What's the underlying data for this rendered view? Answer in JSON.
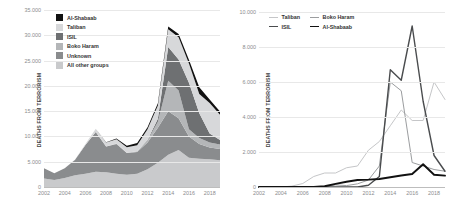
{
  "chart_data": [
    {
      "type": "area",
      "panel": "left",
      "title": "",
      "xlabel": "",
      "ylabel": "DEATHS FROM TERRORISM",
      "xlim": [
        2002,
        2019
      ],
      "ylim": [
        0,
        35000
      ],
      "grid": true,
      "stacked": true,
      "legend_position": "top-left",
      "x": [
        2002,
        2003,
        2004,
        2005,
        2006,
        2007,
        2008,
        2009,
        2010,
        2011,
        2012,
        2013,
        2014,
        2015,
        2016,
        2017,
        2018,
        2019
      ],
      "xticks": [
        "2002",
        "2004",
        "2006",
        "2008",
        "2010",
        "2012",
        "2014",
        "2016",
        "2018"
      ],
      "yticks": [
        "0",
        "5.000",
        "10.000",
        "15.000",
        "20.000",
        "25.000",
        "30.000",
        "35.000"
      ],
      "series": [
        {
          "name": "All other groups",
          "color": "#c9cacc",
          "values": [
            1700,
            1400,
            1800,
            2300,
            2600,
            3000,
            2900,
            2600,
            2400,
            2600,
            3500,
            4800,
            6400,
            7300,
            5800,
            5600,
            5500,
            5300
          ]
        },
        {
          "name": "Unknown",
          "color": "#8a8c8e",
          "values": [
            2000,
            1300,
            1900,
            3100,
            5700,
            7900,
            5100,
            5900,
            4300,
            4300,
            5300,
            6900,
            8600,
            6300,
            4200,
            2900,
            2300,
            2200
          ]
        },
        {
          "name": "Boko Haram",
          "color": "#b4b6b8",
          "values": [
            0,
            0,
            0,
            0,
            0,
            0,
            20,
            120,
            80,
            180,
            400,
            1200,
            6000,
            5500,
            1400,
            1200,
            1000,
            900
          ]
        },
        {
          "name": "ISIL",
          "color": "#6e7072",
          "values": [
            0,
            0,
            0,
            0,
            0,
            0,
            0,
            0,
            0,
            0,
            100,
            600,
            6700,
            6100,
            9200,
            4900,
            1800,
            900
          ]
        },
        {
          "name": "Taliban",
          "color": "#d7d8da",
          "values": [
            0,
            0,
            0,
            50,
            200,
            600,
            800,
            800,
            1100,
            1200,
            2100,
            2600,
            3500,
            4400,
            3800,
            3800,
            6000,
            5000
          ]
        },
        {
          "name": "Al-Shabaab",
          "color": "#111111",
          "values": [
            0,
            0,
            0,
            0,
            0,
            0,
            40,
            180,
            300,
            400,
            420,
            460,
            560,
            660,
            740,
            1300,
            700,
            650
          ]
        }
      ]
    },
    {
      "type": "line",
      "panel": "right",
      "title": "",
      "xlabel": "",
      "ylabel": "DEATHS FROM TERRORISM",
      "xlim": [
        2002,
        2019
      ],
      "ylim": [
        0,
        10000
      ],
      "grid": true,
      "legend_position": "top-center",
      "x": [
        2002,
        2003,
        2004,
        2005,
        2006,
        2007,
        2008,
        2009,
        2010,
        2011,
        2012,
        2013,
        2014,
        2015,
        2016,
        2017,
        2018,
        2019
      ],
      "xticks": [
        "2002",
        "2004",
        "2006",
        "2008",
        "2010",
        "2012",
        "2014",
        "2016",
        "2018"
      ],
      "yticks": [
        "0",
        "2.000",
        "4.000",
        "6.000",
        "8.000",
        "10.000"
      ],
      "series": [
        {
          "name": "Taliban",
          "color": "#c5c6c8",
          "width": 1,
          "values": [
            0,
            0,
            0,
            50,
            200,
            600,
            800,
            800,
            1100,
            1200,
            2100,
            2600,
            3500,
            4400,
            3800,
            3800,
            6000,
            5000
          ]
        },
        {
          "name": "Boko Haram",
          "color": "#9b9d9f",
          "width": 1,
          "values": [
            0,
            0,
            0,
            0,
            0,
            0,
            20,
            120,
            80,
            180,
            400,
            1200,
            6000,
            5500,
            1400,
            1200,
            1000,
            900
          ]
        },
        {
          "name": "ISIL",
          "color": "#4a4c4e",
          "width": 1.4,
          "values": [
            0,
            0,
            0,
            0,
            0,
            0,
            0,
            0,
            0,
            0,
            100,
            600,
            6700,
            6100,
            9200,
            4900,
            1800,
            900
          ]
        },
        {
          "name": "Al-Shabaab",
          "color": "#111111",
          "width": 1.9,
          "values": [
            0,
            0,
            0,
            0,
            0,
            0,
            40,
            180,
            300,
            400,
            420,
            460,
            560,
            660,
            740,
            1300,
            700,
            650
          ]
        }
      ]
    }
  ],
  "left_panel": {
    "ylabel": "DEATHS FROM TERRORISM",
    "legend": [
      {
        "label": "Al-Shabaab",
        "color": "#111111"
      },
      {
        "label": "Taliban",
        "color": "#d7d8da"
      },
      {
        "label": "ISIL",
        "color": "#6e7072"
      },
      {
        "label": "Boko Haram",
        "color": "#b4b6b8"
      },
      {
        "label": "Unknown",
        "color": "#8a8c8e"
      },
      {
        "label": "All other groups",
        "color": "#c9cacc"
      }
    ]
  },
  "right_panel": {
    "ylabel": "DEATHS FROM TERRORISM",
    "legend": [
      {
        "label": "Taliban",
        "color": "#c5c6c8"
      },
      {
        "label": "Boko Haram",
        "color": "#9b9d9f"
      },
      {
        "label": "ISIL",
        "color": "#4a4c4e"
      },
      {
        "label": "Al-Shabaab",
        "color": "#111111"
      }
    ]
  }
}
